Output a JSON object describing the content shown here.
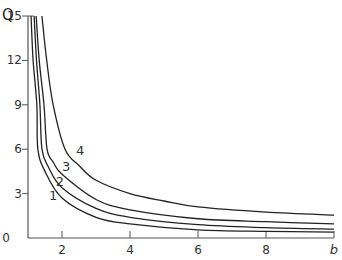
{
  "chart_data": {
    "type": "line",
    "title": "",
    "xlabel": "b",
    "ylabel": "Q",
    "xlim": [
      1,
      10
    ],
    "ylim": [
      0,
      15
    ],
    "x_ticks": [
      2,
      4,
      6,
      8,
      10
    ],
    "x_tick_labels": [
      "2",
      "4",
      "6",
      "8",
      "b"
    ],
    "y_ticks": [
      0,
      3,
      6,
      9,
      12,
      15
    ],
    "y_tick_labels": [
      "0",
      "3",
      "6",
      "9",
      "12",
      "15"
    ],
    "grid": false,
    "legend": "none (curves labelled inline 1-4)",
    "series": [
      {
        "name": "1",
        "x": [
          1.09,
          1.15,
          1.26,
          1.29,
          1.5,
          2,
          3,
          4,
          6,
          8,
          10
        ],
        "y": [
          15,
          12,
          9,
          6,
          4.5,
          2.7,
          1.4,
          0.95,
          0.55,
          0.45,
          0.4
        ]
      },
      {
        "name": "2",
        "x": [
          1.18,
          1.25,
          1.35,
          1.41,
          1.6,
          2,
          3,
          4,
          6,
          8,
          10
        ],
        "y": [
          15,
          12,
          9,
          6,
          4.8,
          3.4,
          2.0,
          1.4,
          0.9,
          0.7,
          0.6
        ]
      },
      {
        "name": "3",
        "x": [
          1.24,
          1.33,
          1.47,
          1.56,
          1.75,
          2,
          3,
          4,
          6,
          8,
          10
        ],
        "y": [
          15,
          12,
          9,
          6,
          5.1,
          4.3,
          2.6,
          1.9,
          1.3,
          1.1,
          0.95
        ]
      },
      {
        "name": "4",
        "x": [
          1.41,
          1.55,
          1.74,
          2.09,
          2.5,
          3,
          4,
          5,
          6,
          8,
          10
        ],
        "y": [
          15,
          12,
          9,
          6,
          4.9,
          3.9,
          3.0,
          2.5,
          2.1,
          1.75,
          1.55
        ]
      }
    ],
    "annotations": [
      {
        "text": "1",
        "x": 1.74,
        "y": 2.6
      },
      {
        "text": "2",
        "x": 1.94,
        "y": 3.5
      },
      {
        "text": "3",
        "x": 2.12,
        "y": 4.5
      },
      {
        "text": "4",
        "x": 2.53,
        "y": 5.6
      }
    ]
  }
}
